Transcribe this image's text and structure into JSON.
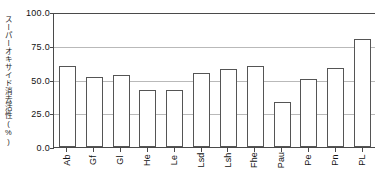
{
  "chart_data": {
    "type": "bar",
    "title": "",
    "xlabel": "",
    "ylabel": "スーパーオキサイド消去活性(%)",
    "categories": [
      "Ab",
      "Gf",
      "Gl",
      "He",
      "Le",
      "Lsd",
      "Lsh",
      "Fhe",
      "Pau",
      "Pe",
      "Pn",
      "PL"
    ],
    "values": [
      60.0,
      51.5,
      53.5,
      42.0,
      42.0,
      55.0,
      58.0,
      60.0,
      33.0,
      50.5,
      58.5,
      80.0
    ],
    "ylim": [
      0.0,
      100.0
    ],
    "yticks": [
      0.0,
      25.0,
      50.0,
      75.0,
      100.0
    ],
    "ytick_labels": [
      "0.0",
      "25.0",
      "50.0",
      "75.0",
      "100.0"
    ],
    "grid": true,
    "legend": null,
    "bar_fill_color": "#ffffff",
    "bar_edge_color": "#555555",
    "grid_color": "#b9b9b9",
    "axis_color": "#4a4a4a"
  }
}
